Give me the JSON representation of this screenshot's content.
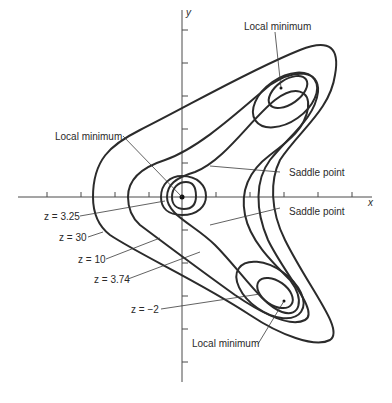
{
  "diagram": {
    "type": "contour plot",
    "axes": {
      "x_label": "x",
      "y_label": "y"
    },
    "points": [
      {
        "label": "Local minimum",
        "position": "upper right"
      },
      {
        "label": "Local minimum",
        "position": "origin"
      },
      {
        "label": "Local minimum",
        "position": "lower right"
      },
      {
        "label": "Saddle point",
        "position": "upper"
      },
      {
        "label": "Saddle point",
        "position": "lower"
      }
    ],
    "contours": [
      {
        "label": "z = 3.25"
      },
      {
        "label": "z = 30"
      },
      {
        "label": "z = 10"
      },
      {
        "label": "z = 3.74"
      },
      {
        "label": "z = −2"
      }
    ]
  },
  "labels": {
    "local_min_top": "Local minimum",
    "local_min_center": "Local minimum",
    "local_min_bottom": "Local minimum",
    "saddle_top": "Saddle point",
    "saddle_bottom": "Saddle point",
    "z325": "z = 3.25",
    "z30": "z = 30",
    "z10": "z = 10",
    "z374": "z = 3.74",
    "zm2": "z = −2",
    "x_axis": "x",
    "y_axis": "y"
  }
}
